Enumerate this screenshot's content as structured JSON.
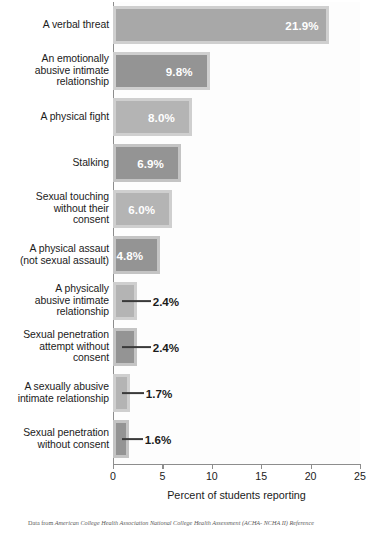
{
  "chart_data": {
    "type": "bar",
    "orientation": "horizontal",
    "title": "",
    "xlabel": "Percent of students reporting",
    "ylabel": "",
    "xlim": [
      0,
      25
    ],
    "xticks": [
      0,
      5,
      10,
      15,
      20,
      25
    ],
    "xtick_labels": [
      "0",
      "5",
      "10",
      "15",
      "20",
      "25"
    ],
    "grid": false,
    "legend": null,
    "value_suffix": "%",
    "categories": [
      "A verbal threat",
      "An emotionally abusive intimate relationship",
      "A physical fight",
      "Stalking",
      "Sexual touching without their consent",
      "A physical assaut (not sexual assault)",
      "A physically abusive intimate relationship",
      "Sexual penetration attempt without consent",
      "A sexually abusive intimate relationship",
      "Sexual penetration without consent"
    ],
    "values": [
      21.9,
      9.8,
      8.0,
      6.9,
      6.0,
      4.8,
      2.4,
      2.4,
      1.7,
      1.6
    ],
    "value_labels": [
      "21.9%",
      "9.8%",
      "8.0%",
      "6.9%",
      "6.0%",
      "4.8%",
      "2.4%",
      "2.4%",
      "1.7%",
      "1.6%"
    ],
    "bars": [
      {
        "label_lines": [
          "A verbal threat"
        ],
        "value": 21.9,
        "value_label": "21.9%",
        "label_placement": "inside",
        "fill": "#a8a8a8",
        "frame": "#cfcfcf"
      },
      {
        "label_lines": [
          "An emotionally",
          "abusive intimate",
          "relationship"
        ],
        "value": 9.8,
        "value_label": "9.8%",
        "label_placement": "inside",
        "fill": "#949494",
        "frame": "#cfcfcf"
      },
      {
        "label_lines": [
          "A physical fight"
        ],
        "value": 8.0,
        "value_label": "8.0%",
        "label_placement": "inside",
        "fill": "#b4b4b4",
        "frame": "#cfcfcf"
      },
      {
        "label_lines": [
          "Stalking"
        ],
        "value": 6.9,
        "value_label": "6.9%",
        "label_placement": "inside",
        "fill": "#949494",
        "frame": "#c4c4c4"
      },
      {
        "label_lines": [
          "Sexual touching",
          "without their",
          "consent"
        ],
        "value": 6.0,
        "value_label": "6.0%",
        "label_placement": "inside",
        "fill": "#b4b4b4",
        "frame": "#cfcfcf"
      },
      {
        "label_lines": [
          "A physical assaut",
          "(not sexual assault)"
        ],
        "value": 4.8,
        "value_label": "4.8%",
        "label_placement": "inside",
        "fill": "#949494",
        "frame": "#c4c4c4"
      },
      {
        "label_lines": [
          "A physically",
          "abusive intimate",
          "relationship"
        ],
        "value": 2.4,
        "value_label": "2.4%",
        "label_placement": "outside",
        "fill": "#b4b4b4",
        "frame": "#cfcfcf"
      },
      {
        "label_lines": [
          "Sexual penetration",
          "attempt without",
          "consent"
        ],
        "value": 2.4,
        "value_label": "2.4%",
        "label_placement": "outside",
        "fill": "#949494",
        "frame": "#c4c4c4"
      },
      {
        "label_lines": [
          "A sexually abusive",
          "intimate relationship"
        ],
        "value": 1.7,
        "value_label": "1.7%",
        "label_placement": "outside",
        "fill": "#b4b4b4",
        "frame": "#cfcfcf"
      },
      {
        "label_lines": [
          "Sexual penetration",
          "without consent"
        ],
        "value": 1.6,
        "value_label": "1.6%",
        "label_placement": "outside",
        "fill": "#949494",
        "frame": "#c4c4c4"
      }
    ]
  },
  "source_note": {
    "prefix": "Data from ",
    "citation": "American College Health Association National College Health Assessment (ACHA- NCHA II) Reference"
  }
}
